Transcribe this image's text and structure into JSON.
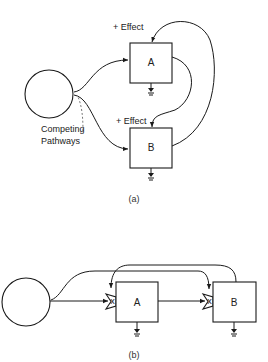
{
  "diagram_a": {
    "caption": "(a)",
    "source_node": "",
    "box_a_label": "A",
    "box_b_label": "B",
    "effect_label_a": "+ Effect",
    "effect_label_b": "+ Effect",
    "annotation_line1": "Competing",
    "annotation_line2": "Pathways"
  },
  "diagram_b": {
    "caption": "(b)",
    "box_a_label": "A",
    "box_b_label": "B",
    "gate_a_mark": "x",
    "gate_b_mark": "x"
  },
  "colors": {
    "ink": "#1a1a1a",
    "background": "#ffffff"
  }
}
